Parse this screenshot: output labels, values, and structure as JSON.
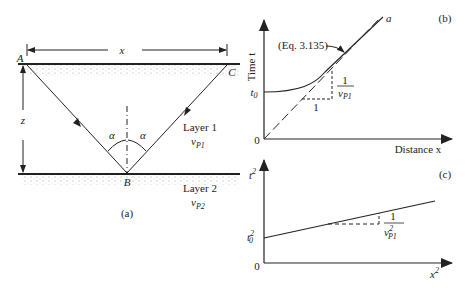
{
  "panel_a": {
    "caption": "(a)",
    "point_a": "A",
    "point_b": "B",
    "point_c": "C",
    "distance_label": "x",
    "depth_label": "z",
    "angle_left": "α",
    "angle_right": "α",
    "layer1_name": "Layer 1",
    "layer1_velocity": "v",
    "layer1_velocity_sub": "P1",
    "layer2_name": "Layer 2",
    "layer2_velocity": "v",
    "layer2_velocity_sub": "P2"
  },
  "panel_b": {
    "caption": "(b)",
    "y_axis_label": "Time t",
    "x_axis_label": "Distance x",
    "origin_label": "0",
    "intercept_label": "t",
    "intercept_sub": "0",
    "curve_annotation": "(Eq. 3.135)",
    "asymptote_label": "a",
    "slope_run": "1",
    "slope_num": "1",
    "slope_den": "v",
    "slope_den_sub": "P1"
  },
  "panel_c": {
    "caption": "(c)",
    "y_axis_label": "t",
    "y_axis_sup": "2",
    "x_axis_label": "x",
    "x_axis_sup": "2",
    "origin_label": "0",
    "intercept_label": "t",
    "intercept_sup": "2",
    "intercept_sub": "0",
    "slope_num": "1",
    "slope_den": "v",
    "slope_den_sup": "2",
    "slope_den_sub": "P1"
  }
}
